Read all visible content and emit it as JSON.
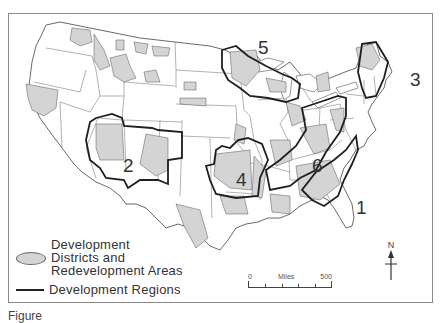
{
  "figure": {
    "type": "thematic-map",
    "caption_partial": "Figure"
  },
  "legend": {
    "items": [
      {
        "symbol": "shaded-ellipse",
        "label_lines": [
          "Development",
          "Districts and",
          "Redevelopment Areas"
        ]
      },
      {
        "symbol": "heavy-line",
        "label": "Development Regions"
      }
    ]
  },
  "regions": [
    {
      "number": "1",
      "location": "Southeast (Carolinas/Georgia)"
    },
    {
      "number": "2",
      "location": "Four Corners (Arizona/New Mexico)"
    },
    {
      "number": "3",
      "location": "New England"
    },
    {
      "number": "4",
      "location": "Ozarks"
    },
    {
      "number": "5",
      "location": "Upper Great Lakes"
    },
    {
      "number": "6",
      "location": "Appalachia"
    }
  ],
  "scale": {
    "start": "0",
    "unit": "Miles",
    "end": "500"
  },
  "north_arrow": {
    "label": "N"
  },
  "colors": {
    "shaded_area": "#d4d4d4",
    "region_border": "#1e1e1e",
    "state_border": "#555555",
    "frame": "#8a8a8a"
  }
}
